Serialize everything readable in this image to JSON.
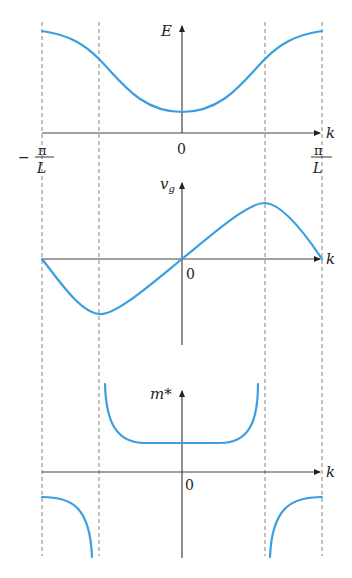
{
  "figure": {
    "colors": {
      "curve": "#3a9ee0",
      "axis": "#444444",
      "dashed": "#777777"
    },
    "x_axis_label": "k",
    "x_ticks": {
      "left_num": "π",
      "left_den": "L",
      "left_sign": "−",
      "center": "0",
      "right_num": "π",
      "right_den": "L"
    },
    "panels": [
      {
        "id": "energy",
        "y_label": "E",
        "x_label": "k",
        "origin_label": "0"
      },
      {
        "id": "group-velocity",
        "y_label": "v",
        "y_label_sub": "g",
        "x_label": "k",
        "origin_label": "0"
      },
      {
        "id": "effective-mass",
        "y_label": "m*",
        "x_label": "k",
        "origin_label": "0"
      }
    ]
  }
}
